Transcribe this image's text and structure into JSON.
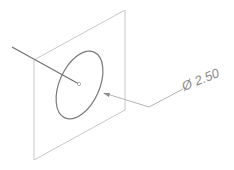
{
  "diagram": {
    "type": "cad-isometric-annotation",
    "dimension": {
      "symbol": "Ø",
      "value": "2.50",
      "label": "Ø 2.50"
    },
    "colors": {
      "plane_edge": "#c8c8c8",
      "circle": "#7a7a7a",
      "axis": "#6e6e6e",
      "leader": "#b4b4b4",
      "text": "#8a8a8a"
    },
    "elements": [
      "sketch-plane",
      "circle",
      "center-point",
      "axis-line",
      "leader-arrow",
      "dimension-label"
    ]
  }
}
